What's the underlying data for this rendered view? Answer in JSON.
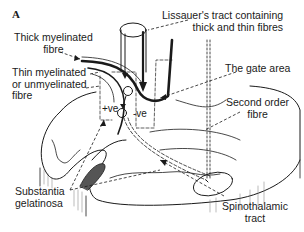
{
  "panel_label": "A",
  "labels": {
    "thick_fibre": [
      "Thick myelinated",
      "fibre"
    ],
    "thin_fibre": [
      "Thin myelinated",
      "or unmyelinated",
      "fibre"
    ],
    "lissauer": [
      "Lissauer's tract containing",
      "thick and thin fibres"
    ],
    "gate_area": "The gate area",
    "second_order": [
      "Second order",
      "fibre"
    ],
    "substantia": [
      "Substantia",
      "gelatinosa"
    ],
    "spinothalamic": [
      "Spinothalamic",
      "tract"
    ],
    "plus_ve": "+ve",
    "minus_ve": "-ve"
  },
  "colors": {
    "ink": "#1a1a1a",
    "shade": "#555555",
    "background": "#ffffff"
  }
}
